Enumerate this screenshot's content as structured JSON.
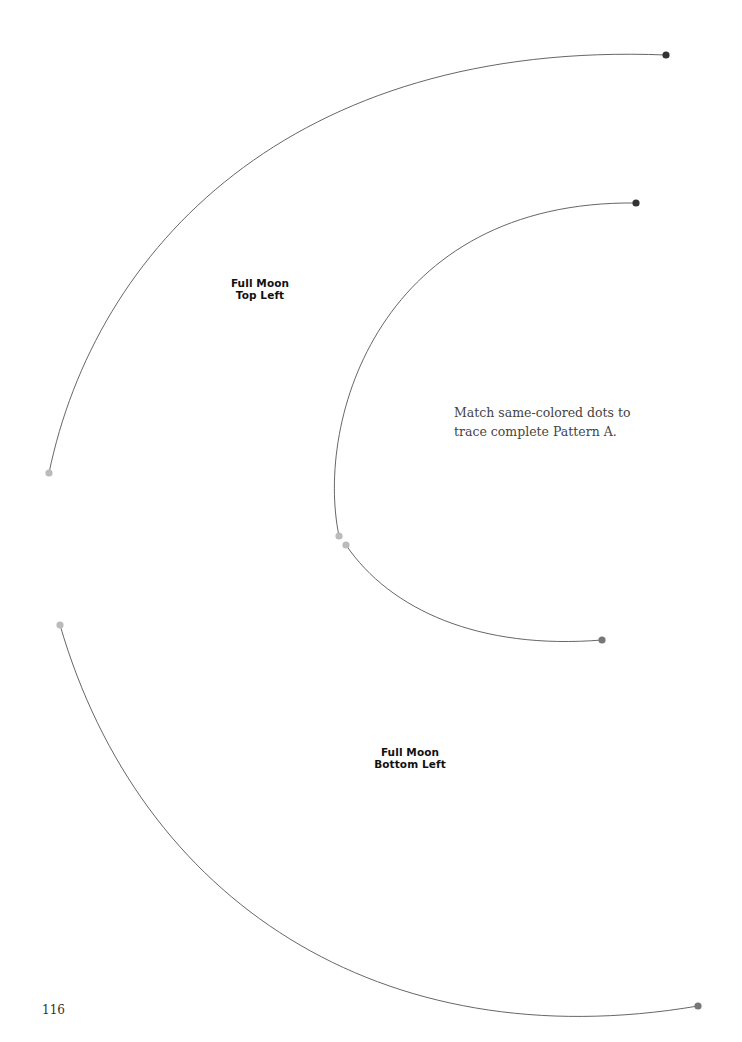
{
  "labels": {
    "top_left": {
      "line1": "Full Moon",
      "line2": "Top Left"
    },
    "bottom_left": {
      "line1": "Full Moon",
      "line2": "Bottom Left"
    }
  },
  "instruction": {
    "line1": "Match same-colored dots to",
    "line2": "trace complete Pattern A."
  },
  "page_number": "116",
  "colors": {
    "line": "#555555",
    "dot_dark": "#333333",
    "dot_light": "#bbbbbb",
    "dot_medium": "#777777"
  },
  "arcs": [
    {
      "name": "top-left-outer-arc",
      "start_dot": "light",
      "end_dot": "dark"
    },
    {
      "name": "inner-upper-arc",
      "start_dot": "light",
      "end_dot": "dark"
    },
    {
      "name": "inner-lower-arc",
      "start_dot": "light",
      "end_dot": "medium"
    },
    {
      "name": "bottom-left-outer-arc",
      "start_dot": "light",
      "end_dot": "medium"
    }
  ]
}
